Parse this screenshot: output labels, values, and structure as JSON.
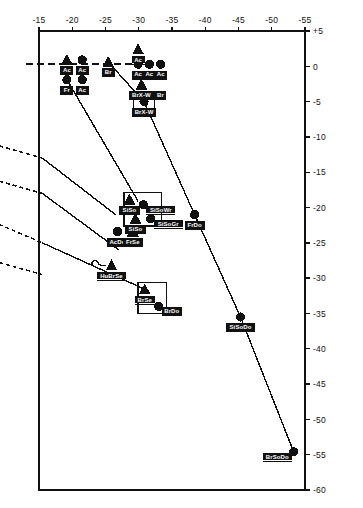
{
  "figure": {
    "partial_caption_top": "",
    "background": "#ffffff",
    "ink": "#111111"
  },
  "chart_data": {
    "type": "scatter",
    "title": "",
    "xlabel": "",
    "ylabel": "",
    "xlim": [
      -15,
      -55
    ],
    "ylim": [
      5,
      -60
    ],
    "x_ticks": [
      "-15",
      "-20",
      "-25",
      "-30",
      "-35",
      "-40",
      "-45",
      "-50",
      "-55"
    ],
    "x_tick_values": [
      -15,
      -20,
      -25,
      -30,
      -35,
      -40,
      -45,
      -50,
      -55
    ],
    "y_ticks": [
      "+5",
      "0",
      "-5",
      "-10",
      "-15",
      "-20",
      "-25",
      "-30",
      "-35",
      "-40",
      "-45",
      "-50",
      "-55",
      "-60"
    ],
    "y_tick_values": [
      5,
      0,
      -5,
      -10,
      -15,
      -20,
      -25,
      -30,
      -35,
      -40,
      -45,
      -50,
      -55,
      -60
    ],
    "x_axis_position": "top",
    "y_axis_position": "right",
    "grid": false,
    "legend": null,
    "marker_shapes": [
      "triangle",
      "circle"
    ],
    "points": [
      {
        "label": "Ac",
        "x": -19.2,
        "y": 0.9,
        "shape": "triangle",
        "label_pos": "below"
      },
      {
        "label": "Ac",
        "x": -21.5,
        "y": 0.9,
        "shape": "circle",
        "label_pos": "below"
      },
      {
        "label": "Fr",
        "x": -19.2,
        "y": -1.9,
        "shape": "circle",
        "label_pos": "below"
      },
      {
        "label": "Ac",
        "x": -21.5,
        "y": -1.9,
        "shape": "circle",
        "label_pos": "below"
      },
      {
        "label": "Br",
        "x": -25.4,
        "y": 0.6,
        "shape": "triangle",
        "label_pos": "below"
      },
      {
        "label": "Ac",
        "x": -29.9,
        "y": 2.4,
        "shape": "triangle",
        "label_pos": "below"
      },
      {
        "label": "Ac",
        "x": -29.9,
        "y": 0.3,
        "shape": "circle",
        "label_pos": "below"
      },
      {
        "label": "Ac",
        "x": -31.6,
        "y": 0.3,
        "shape": "circle",
        "label_pos": "below"
      },
      {
        "label": "Ac",
        "x": -33.3,
        "y": 0.3,
        "shape": "circle",
        "label_pos": "below"
      },
      {
        "label": "BrX-W",
        "x": -30.4,
        "y": -2.6,
        "shape": "triangle",
        "label_pos": "below",
        "label2": "Br"
      },
      {
        "label": "BrX-W",
        "x": -30.8,
        "y": -5.0,
        "shape": "circle",
        "label_pos": "below"
      },
      {
        "label": "SiSo",
        "x": -28.6,
        "y": -18.9,
        "shape": "triangle",
        "label_pos": "below"
      },
      {
        "label": "SiSoWr",
        "x": -30.7,
        "y": -19.6,
        "shape": "circle",
        "label_pos": "right"
      },
      {
        "label": "SiSo",
        "x": -29.5,
        "y": -21.6,
        "shape": "triangle",
        "label_pos": "below"
      },
      {
        "label": "SiSoGr",
        "x": -31.8,
        "y": -21.6,
        "shape": "circle",
        "label_pos": "right"
      },
      {
        "label": "FrDo",
        "x": -38.4,
        "y": -21.0,
        "shape": "circle",
        "label_pos": "below"
      },
      {
        "label": "AcDo",
        "x": -26.8,
        "y": -23.4,
        "shape": "circle",
        "label_pos": "below"
      },
      {
        "label": "FrSe",
        "x": -29.1,
        "y": -23.4,
        "shape": "triangle",
        "label_pos": "below"
      },
      {
        "label": "HuBrSe",
        "x": -25.9,
        "y": -28.2,
        "shape": "triangle",
        "label_pos": "below"
      },
      {
        "label": "BrSe",
        "x": -30.9,
        "y": -31.6,
        "shape": "triangle",
        "label_pos": "below"
      },
      {
        "label": "BrDo",
        "x": -33.0,
        "y": -34.0,
        "shape": "circle",
        "label_pos": "right"
      },
      {
        "label": "SiSoDo",
        "x": -45.3,
        "y": -35.5,
        "shape": "circle",
        "label_pos": "below"
      },
      {
        "label": "BrSoDo",
        "x": -53.3,
        "y": -54.6,
        "shape": "circle",
        "label_pos": "left"
      }
    ],
    "connector_lines": [
      {
        "from": [
          -19.2,
          -1.9
        ],
        "to": [
          -29.9,
          -19.1
        ],
        "style": "solid"
      },
      {
        "from": [
          -25.4,
          0.6
        ],
        "to": [
          -30.8,
          -5.0
        ],
        "style": "solid"
      },
      {
        "from": [
          -30.8,
          -5.0
        ],
        "to": [
          -38.4,
          -21.0
        ],
        "style": "solid"
      },
      {
        "from": [
          -38.4,
          -21.0
        ],
        "to": [
          -45.3,
          -35.5
        ],
        "style": "solid"
      },
      {
        "from": [
          -45.3,
          -35.5
        ],
        "to": [
          -53.3,
          -54.6
        ],
        "style": "solid"
      },
      {
        "from": [
          -15.5,
          -13.0
        ],
        "to": [
          -26.5,
          -21.0
        ],
        "style": "solid"
      },
      {
        "from": [
          -15.5,
          -18.0
        ],
        "to": [
          -27.0,
          -26.0
        ],
        "style": "solid"
      },
      {
        "from": [
          -15.5,
          -25.0
        ],
        "to": [
          -30.5,
          -31.4
        ],
        "style": "solid"
      }
    ],
    "dashed_lines": [
      {
        "from": [
          -13.0,
          0.3
        ],
        "to": [
          -33.8,
          0.3
        ],
        "style": "dashed",
        "note": "horizontal zero-level dashed line extending left beyond axis"
      },
      {
        "from": [
          -8.0,
          -11.0
        ],
        "to": [
          -15.5,
          -13.0
        ],
        "style": "dashed"
      },
      {
        "from": [
          -8.0,
          -16.0
        ],
        "to": [
          -15.5,
          -18.0
        ],
        "style": "dashed"
      },
      {
        "from": [
          -8.0,
          -22.0
        ],
        "to": [
          -15.5,
          -25.0
        ],
        "style": "dashed"
      },
      {
        "from": [
          -8.0,
          -27.5
        ],
        "to": [
          -15.5,
          -29.5
        ],
        "style": "dashed"
      }
    ],
    "enclosures": [
      {
        "name": "sisos-cluster-box",
        "points": [
          [
            -27.8,
            -17.9
          ],
          [
            -33.4,
            -17.9
          ],
          [
            -33.4,
            -22.6
          ],
          [
            -27.8,
            -22.6
          ]
        ]
      },
      {
        "name": "brse-cluster-box",
        "points": [
          [
            -29.9,
            -30.6
          ],
          [
            -34.2,
            -30.6
          ],
          [
            -34.2,
            -35.0
          ],
          [
            -29.9,
            -35.0
          ]
        ]
      },
      {
        "name": "brxw-cluster-box",
        "points": [
          [
            -29.2,
            -3.6
          ],
          [
            -32.4,
            -3.6
          ],
          [
            -32.4,
            -6.1
          ],
          [
            -29.2,
            -6.1
          ]
        ]
      }
    ]
  }
}
